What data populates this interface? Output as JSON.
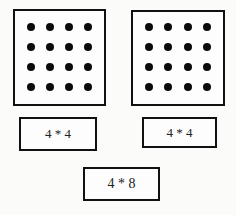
{
  "figure": {
    "arrays": [
      {
        "rows": 4,
        "cols": 4,
        "total_dots": 16
      },
      {
        "rows": 4,
        "cols": 4,
        "total_dots": 16
      }
    ],
    "labels": {
      "left": "4 * 4",
      "right": "4 * 4",
      "bottom": "4 * 8"
    },
    "colors": {
      "stroke": "#111111",
      "dot": "#0a0a0a",
      "background": "#fbfbfa"
    }
  }
}
